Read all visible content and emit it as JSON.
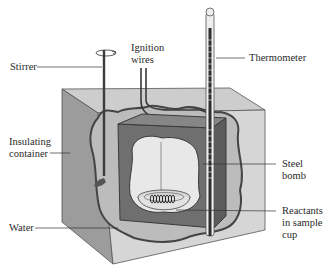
{
  "diagram": {
    "labels": {
      "stirrer": "Stirrer",
      "ignition_line1": "Ignition",
      "ignition_line2": "wires",
      "thermometer": "Thermometer",
      "insulating_line1": "Insulating",
      "insulating_line2": "container",
      "steel_line1": "Steel",
      "steel_line2": "bomb",
      "water": "Water",
      "reactants_line1": "Reactants",
      "reactants_line2": "in sample",
      "reactants_line3": "cup"
    },
    "colors": {
      "outer_front": "#9a9a9a",
      "outer_top": "#c9c9c9",
      "outer_side": "#d4d4d4",
      "water": "#bdbdbd",
      "bomb": "#6e6e6e",
      "bomb_interior": "#e6e6e6",
      "outline": "#444444"
    }
  }
}
